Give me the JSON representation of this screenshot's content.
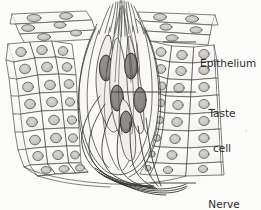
{
  "figure": {
    "caption": "",
    "background_color": "#fbfbf9",
    "ink_color": "#3a3a3a",
    "nucleus_fill": "#c8c6c0",
    "taste_cell_fill": "#8c8a86",
    "taste_cell_nucleus_fill": "#9b9792"
  },
  "labels": [
    {
      "id": "epithelium",
      "name": "label-epithelium",
      "lines": [
        "Epithelium"
      ],
      "align": "left",
      "x": 200,
      "y": 35,
      "leader": {
        "x1": 163,
        "y1": 42,
        "x2": 196,
        "y2": 42
      }
    },
    {
      "id": "taste-cell",
      "name": "label-taste-cell",
      "lines": [
        "Taste",
        "cell"
      ],
      "align": "center",
      "x": 200,
      "y": 85,
      "leader": {
        "x1": 112,
        "y1": 92,
        "x2": 196,
        "y2": 92
      }
    },
    {
      "id": "nerve-fibers",
      "name": "label-nerve-fibers",
      "lines": [
        "Nerve",
        "fibers"
      ],
      "align": "center",
      "x": 200,
      "y": 176,
      "leader": {
        "x1": 152,
        "y1": 183,
        "x2": 196,
        "y2": 183
      }
    }
  ],
  "structures": {
    "epithelium": "Flattened surface epithelial cells overlying rounded basal epithelial cells",
    "taste_bud": "Ovoid cluster of elongated taste receptor cells with dark nuclei",
    "taste_pore": "Apical opening with microvilli (taste hairs) projecting upward",
    "nerve_fibers": "Bundle of afferent nerve fibers entering the base of the taste bud"
  }
}
